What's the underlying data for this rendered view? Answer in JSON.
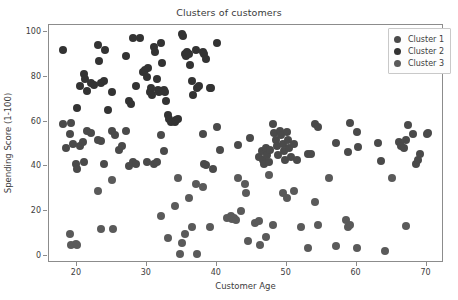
{
  "chart_data": {
    "type": "scatter",
    "title": "Clusters of customers",
    "xlabel": "Customer Age",
    "ylabel": "Spending Score (1-100)",
    "xlim": [
      16,
      72.5
    ],
    "ylim": [
      -3,
      103
    ],
    "xticks": [
      20,
      30,
      40,
      50,
      60,
      70
    ],
    "yticks": [
      0,
      20,
      40,
      60,
      80,
      100
    ],
    "grid": false,
    "legend_position": "upper right",
    "marker_size_px": 8,
    "series": [
      {
        "name": "Cluster 1",
        "color": "#4a4a4a",
        "points": [
          [
            18,
            59
          ],
          [
            18.4,
            48
          ],
          [
            19,
            54.5
          ],
          [
            19.2,
            59.5
          ],
          [
            19.5,
            50
          ],
          [
            19.8,
            41
          ],
          [
            20,
            39
          ],
          [
            20.5,
            49
          ],
          [
            20.8,
            51
          ],
          [
            21,
            42
          ],
          [
            21.5,
            56
          ],
          [
            22,
            55
          ],
          [
            23,
            52
          ],
          [
            23.5,
            51.5
          ],
          [
            23.8,
            41
          ],
          [
            25,
            56
          ],
          [
            25.5,
            54
          ],
          [
            26,
            47.5
          ],
          [
            26.4,
            49
          ],
          [
            27,
            56
          ],
          [
            27.5,
            40
          ],
          [
            28,
            42
          ],
          [
            28.5,
            41
          ],
          [
            30,
            42
          ],
          [
            31,
            41
          ],
          [
            31.5,
            42
          ],
          [
            32,
            54
          ],
          [
            32.5,
            47
          ],
          [
            38,
            54.5
          ],
          [
            38.2,
            41
          ],
          [
            38.5,
            40.5
          ],
          [
            39.5,
            39
          ],
          [
            40,
            57.5
          ],
          [
            40.5,
            47.5
          ],
          [
            43,
            49.5
          ],
          [
            44.8,
            52.5
          ],
          [
            46,
            44
          ],
          [
            46.4,
            47
          ],
          [
            46.6,
            43
          ],
          [
            46.8,
            41
          ],
          [
            47,
            48
          ],
          [
            47.2,
            45
          ],
          [
            47.4,
            42
          ],
          [
            47.6,
            47.5
          ],
          [
            48,
            59
          ],
          [
            48.2,
            55
          ],
          [
            48.4,
            52
          ],
          [
            48.6,
            49
          ],
          [
            48.8,
            45
          ],
          [
            49,
            56
          ],
          [
            49.2,
            54
          ],
          [
            49.4,
            50
          ],
          [
            49.6,
            47
          ],
          [
            49.8,
            43
          ],
          [
            50,
            55.5
          ],
          [
            50.2,
            52
          ],
          [
            50.4,
            48
          ],
          [
            50.6,
            44
          ],
          [
            51,
            50
          ],
          [
            51.5,
            43
          ],
          [
            53,
            45.5
          ],
          [
            53.5,
            45.5
          ],
          [
            54,
            59
          ],
          [
            54.5,
            57.5
          ],
          [
            57,
            50.5
          ],
          [
            58.8,
            46.5
          ],
          [
            59,
            59.5
          ],
          [
            60,
            55.5
          ],
          [
            60.2,
            48.5
          ],
          [
            63,
            50.5
          ],
          [
            63.5,
            42.5
          ],
          [
            66,
            51
          ],
          [
            66.4,
            49
          ],
          [
            66.8,
            48
          ],
          [
            67,
            52
          ],
          [
            67.4,
            58.5
          ],
          [
            68,
            54.5
          ],
          [
            68.5,
            41
          ],
          [
            68.8,
            43
          ],
          [
            69,
            45.5
          ],
          [
            70,
            54.5
          ],
          [
            70.2,
            55
          ]
        ]
      },
      {
        "name": "Cluster 2",
        "color": "#333333",
        "points": [
          [
            18,
            92
          ],
          [
            20,
            66
          ],
          [
            20.5,
            76
          ],
          [
            21,
            81
          ],
          [
            21.2,
            79
          ],
          [
            21.5,
            73.5
          ],
          [
            22,
            77
          ],
          [
            22.4,
            76.5
          ],
          [
            23,
            94
          ],
          [
            23.2,
            87
          ],
          [
            23.5,
            77
          ],
          [
            23.8,
            78
          ],
          [
            24,
            92
          ],
          [
            24.5,
            65
          ],
          [
            25,
            73
          ],
          [
            27,
            89
          ],
          [
            27.4,
            69
          ],
          [
            27.8,
            68
          ],
          [
            28,
            97
          ],
          [
            28.4,
            76
          ],
          [
            29,
            97
          ],
          [
            29.5,
            82
          ],
          [
            29.8,
            83
          ],
          [
            30,
            80
          ],
          [
            30.2,
            84
          ],
          [
            30.4,
            73
          ],
          [
            30.6,
            75
          ],
          [
            30.8,
            72
          ],
          [
            31,
            93
          ],
          [
            31.2,
            91
          ],
          [
            31.4,
            79
          ],
          [
            31.6,
            74
          ],
          [
            31.8,
            73
          ],
          [
            32,
            95
          ],
          [
            32.2,
            86
          ],
          [
            32.4,
            74
          ],
          [
            32.6,
            73
          ],
          [
            32.8,
            69
          ],
          [
            33,
            63
          ],
          [
            33.2,
            61
          ],
          [
            33.5,
            60
          ],
          [
            34,
            60
          ],
          [
            34.2,
            60.5
          ],
          [
            34.5,
            61
          ],
          [
            35,
            99
          ],
          [
            35.2,
            98
          ],
          [
            35.4,
            90
          ],
          [
            35.6,
            89
          ],
          [
            35.8,
            91
          ],
          [
            36,
            90
          ],
          [
            36.2,
            85
          ],
          [
            36.4,
            78
          ],
          [
            36.6,
            72
          ],
          [
            37,
            92
          ],
          [
            37.2,
            75
          ],
          [
            37.5,
            76
          ],
          [
            38,
            91
          ],
          [
            38.2,
            90
          ],
          [
            38.5,
            88
          ],
          [
            39,
            75
          ],
          [
            39.2,
            75
          ],
          [
            40,
            95
          ]
        ]
      },
      {
        "name": "Cluster 3",
        "color": "#5a5a5a",
        "points": [
          [
            19,
            10
          ],
          [
            19.2,
            5
          ],
          [
            19.8,
            5.5
          ],
          [
            20,
            5
          ],
          [
            23,
            29
          ],
          [
            23.5,
            12
          ],
          [
            25,
            34
          ],
          [
            25.2,
            12
          ],
          [
            32,
            18
          ],
          [
            33,
            8
          ],
          [
            34,
            22.5
          ],
          [
            34.5,
            35
          ],
          [
            34.8,
            1
          ],
          [
            35,
            6
          ],
          [
            35.5,
            10
          ],
          [
            36,
            26
          ],
          [
            36.5,
            13
          ],
          [
            37,
            32
          ],
          [
            37.2,
            1
          ],
          [
            38,
            31
          ],
          [
            39,
            13
          ],
          [
            41.5,
            17
          ],
          [
            42,
            18
          ],
          [
            42.2,
            16.5
          ],
          [
            42.4,
            17
          ],
          [
            42.8,
            16
          ],
          [
            43,
            35
          ],
          [
            43.5,
            20
          ],
          [
            44,
            32
          ],
          [
            44.2,
            28
          ],
          [
            44.5,
            7
          ],
          [
            45.5,
            15
          ],
          [
            46,
            15.5
          ],
          [
            46.2,
            5
          ],
          [
            47,
            8.5
          ],
          [
            47.5,
            36
          ],
          [
            48,
            14
          ],
          [
            49.5,
            28
          ],
          [
            50,
            26
          ],
          [
            51,
            29
          ],
          [
            52,
            13
          ],
          [
            53,
            3.5
          ],
          [
            54,
            24
          ],
          [
            54.5,
            14
          ],
          [
            56,
            35
          ],
          [
            57,
            4.5
          ],
          [
            58.5,
            16
          ],
          [
            58.8,
            13
          ],
          [
            59,
            14
          ],
          [
            60,
            3.5
          ],
          [
            64,
            2.5
          ],
          [
            65,
            35
          ],
          [
            67,
            13.5
          ]
        ]
      }
    ]
  },
  "legend": {
    "items": [
      {
        "label": "Cluster 1"
      },
      {
        "label": "Cluster 2"
      },
      {
        "label": "Cluster 3"
      }
    ]
  }
}
